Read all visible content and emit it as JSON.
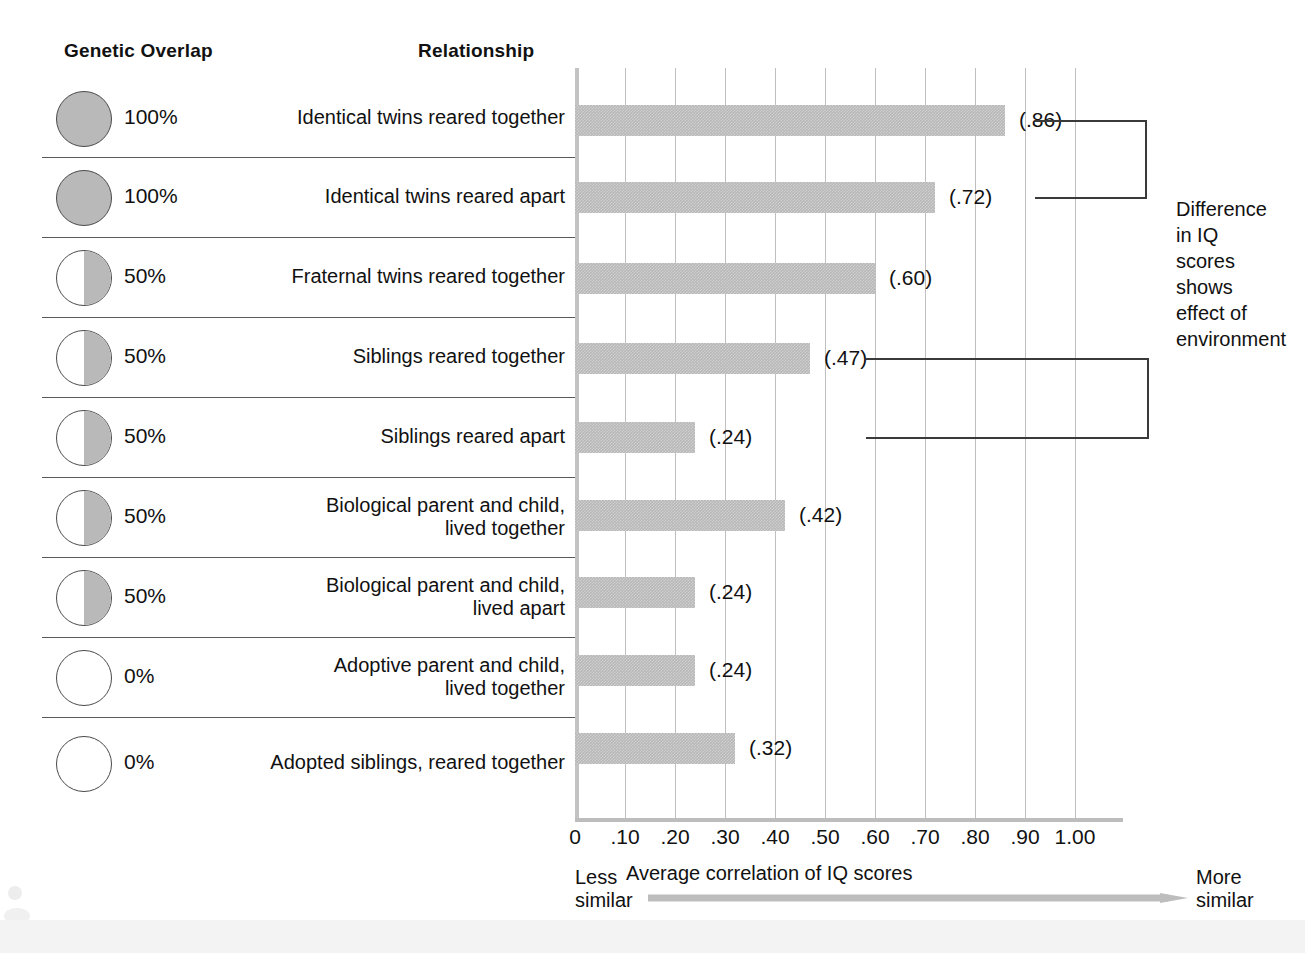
{
  "headers": {
    "genetic_overlap": "Genetic Overlap",
    "relationship": "Relationship"
  },
  "annotation": {
    "text": "Difference in IQ scores shows effect of environment"
  },
  "axis": {
    "title": "Average correlation of IQ scores",
    "less_similar": "Less\nsimilar",
    "more_similar": "More\nsimilar",
    "ticks": [
      "0",
      ".10",
      ".20",
      ".30",
      ".40",
      ".50",
      ".60",
      ".70",
      ".80",
      ".90",
      "1.00"
    ]
  },
  "rows": [
    {
      "genetic": "100%",
      "fill": "full",
      "relationship": "Identical twins reared together",
      "value_label": "(.86)"
    },
    {
      "genetic": "100%",
      "fill": "full",
      "relationship": "Identical twins reared apart",
      "value_label": "(.72)"
    },
    {
      "genetic": "50%",
      "fill": "half",
      "relationship": "Fraternal twins reared together",
      "value_label": "(.60)"
    },
    {
      "genetic": "50%",
      "fill": "half",
      "relationship": "Siblings reared together",
      "value_label": "(.47)"
    },
    {
      "genetic": "50%",
      "fill": "half",
      "relationship": "Siblings reared apart",
      "value_label": "(.24)"
    },
    {
      "genetic": "50%",
      "fill": "half",
      "relationship": "Biological parent and child,\nlived together",
      "value_label": "(.42)"
    },
    {
      "genetic": "50%",
      "fill": "half",
      "relationship": "Biological parent and child,\nlived apart",
      "value_label": "(.24)"
    },
    {
      "genetic": "0%",
      "fill": "none",
      "relationship": "Adoptive parent and child,\nlived together",
      "value_label": "(.24)"
    },
    {
      "genetic": "0%",
      "fill": "none",
      "relationship": "Adopted siblings, reared together",
      "value_label": "(.32)"
    }
  ],
  "colors": {
    "bar": "#b8b8b8",
    "circle_fill": "#b9b9b9",
    "grid": "#bfbfbf",
    "rule": "#5b5b5b",
    "text": "#111111"
  },
  "chart_data": {
    "type": "bar",
    "title": "",
    "xlabel": "Average correlation of IQ scores",
    "ylabel": "",
    "orientation": "horizontal",
    "xlim": [
      0,
      1.0
    ],
    "xticks": [
      0,
      0.1,
      0.2,
      0.3,
      0.4,
      0.5,
      0.6,
      0.7,
      0.8,
      0.9,
      1.0
    ],
    "xticklabels": [
      "0",
      ".10",
      ".20",
      ".30",
      ".40",
      ".50",
      ".60",
      ".70",
      ".80",
      ".90",
      "1.00"
    ],
    "grid": true,
    "legend": "none",
    "categories": [
      "Identical twins reared together",
      "Identical twins reared apart",
      "Fraternal twins reared together",
      "Siblings reared together",
      "Siblings reared apart",
      "Biological parent and child, lived together",
      "Biological parent and child, lived apart",
      "Adoptive parent and child, lived together",
      "Adopted siblings, reared together"
    ],
    "values": [
      0.86,
      0.72,
      0.6,
      0.47,
      0.24,
      0.42,
      0.24,
      0.24,
      0.32
    ],
    "data_labels": [
      "(.86)",
      "(.72)",
      "(.60)",
      "(.47)",
      "(.24)",
      "(.42)",
      "(.24)",
      "(.24)",
      "(.32)"
    ],
    "genetic_overlap": [
      "100%",
      "100%",
      "50%",
      "50%",
      "50%",
      "50%",
      "50%",
      "0%",
      "0%"
    ],
    "annotations": [
      {
        "text": "Difference in IQ scores shows effect of environment",
        "brackets": [
          {
            "from": "Identical twins reared together",
            "to": "Identical twins reared apart"
          },
          {
            "from": "Siblings reared together",
            "to": "Siblings reared apart"
          }
        ]
      }
    ],
    "direction_note": {
      "left": "Less similar",
      "right": "More similar"
    }
  }
}
